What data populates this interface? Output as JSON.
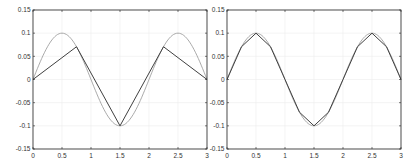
{
  "chart_data": [
    {
      "type": "line",
      "title": "",
      "xlabel": "",
      "ylabel": "",
      "xlim": [
        0,
        3
      ],
      "ylim": [
        -0.15,
        0.15
      ],
      "grid": true,
      "legend": null,
      "x_ticks": [
        0,
        0.5,
        1,
        1.5,
        2,
        2.5,
        3
      ],
      "x_tick_labels": [
        "0",
        "0.5",
        "1",
        "1.5",
        "2",
        "2.5",
        "3"
      ],
      "y_ticks": [
        -0.15,
        -0.1,
        -0.05,
        0,
        0.05,
        0.1,
        0.15
      ],
      "y_tick_labels": [
        "-0.15",
        "-0.1",
        "-0.05",
        "0",
        "0.05",
        "0.1",
        "0.15"
      ],
      "series": [
        {
          "name": "exact",
          "function": "0.1*sin(pi*x)",
          "color": "#a0a0a0",
          "samples": 121
        },
        {
          "name": "piecewise-linear",
          "color": "#404040",
          "x": [
            0,
            0.75,
            1.5,
            2.25,
            3
          ],
          "y": [
            0,
            0.0707,
            -0.1,
            0.0707,
            0
          ]
        }
      ]
    },
    {
      "type": "line",
      "title": "",
      "xlabel": "",
      "ylabel": "",
      "xlim": [
        0,
        3
      ],
      "ylim": [
        -0.15,
        0.15
      ],
      "grid": true,
      "legend": null,
      "x_ticks": [
        0,
        0.5,
        1,
        1.5,
        2,
        2.5,
        3
      ],
      "x_tick_labels": [
        "0",
        "0.5",
        "1",
        "1.5",
        "2",
        "2.5",
        "3"
      ],
      "y_ticks": [
        -0.15,
        -0.1,
        -0.05,
        0,
        0.05,
        0.1,
        0.15
      ],
      "y_tick_labels": [
        "-0.15",
        "-0.1",
        "-0.05",
        "0",
        "0.05",
        "0.1",
        "0.15"
      ],
      "series": [
        {
          "name": "exact",
          "function": "0.1*sin(pi*x)",
          "color": "#a0a0a0",
          "samples": 121
        },
        {
          "name": "piecewise-linear",
          "color": "#404040",
          "x": [
            0,
            0.25,
            0.5,
            0.75,
            1,
            1.25,
            1.5,
            1.75,
            2,
            2.25,
            2.5,
            2.75,
            3
          ],
          "y": [
            0,
            0.0707,
            0.1,
            0.0707,
            0,
            -0.0707,
            -0.1,
            -0.0707,
            0,
            0.0707,
            0.1,
            0.0707,
            0
          ]
        }
      ]
    }
  ],
  "layout": {
    "panels": [
      {
        "left": 33,
        "right": 207,
        "top": 10,
        "bottom": 149
      },
      {
        "left": 227,
        "right": 401,
        "top": 10,
        "bottom": 149
      }
    ],
    "axis_color": "#262626",
    "grid_color": "#ececec"
  }
}
